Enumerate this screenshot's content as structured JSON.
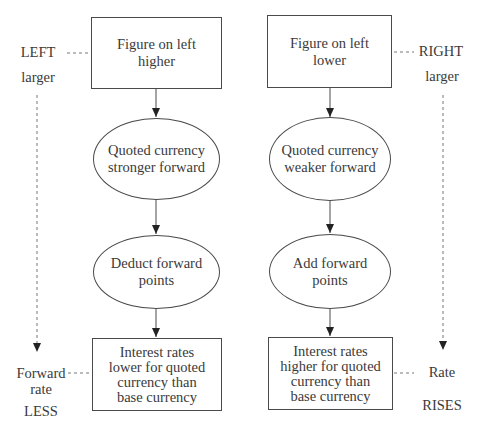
{
  "diagram": {
    "left_column": {
      "start_box": "Figure on left\nhigher",
      "ellipse_1": "Quoted currency\nstronger forward",
      "ellipse_2": "Deduct forward\npoints",
      "end_box": "Interest rates\nlower for quoted\ncurrency than\nbase currency"
    },
    "right_column": {
      "start_box": "Figure on left\nlower",
      "ellipse_1": "Quoted currency\nweaker forward",
      "ellipse_2": "Add forward\npoints",
      "end_box": "Interest rates\nhigher for quoted\ncurrency than\nbase currency"
    },
    "side_labels": {
      "left_top_1": "LEFT",
      "left_top_2": "larger",
      "left_bottom_1": "Forward",
      "left_bottom_2": "rate",
      "left_bottom_3": "LESS",
      "right_top_1": "RIGHT",
      "right_top_2": "larger",
      "right_bottom_1": "Rate",
      "right_bottom_2": "RISES"
    },
    "colors": {
      "line": "#4a4a4a",
      "text": "#3a3a3a",
      "background": "#ffffff"
    }
  }
}
